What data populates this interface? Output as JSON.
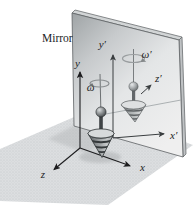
{
  "figure": {
    "title_caption": "Mirror",
    "axes": {
      "x": "x",
      "y": "y",
      "z": "z"
    },
    "mirror_axes": {
      "x": "x′",
      "y": "y′",
      "z": "z′"
    },
    "angular_velocity": "ω",
    "angular_velocity_mirror": "ω′"
  },
  "colors": {
    "ink": "#1d1d1f",
    "mirror_gray_dark": "#9fa4a6",
    "mirror_gray_light": "#eff0f0",
    "floor_gray": "#dcdee0",
    "top_body_gray": "#8f9395"
  }
}
